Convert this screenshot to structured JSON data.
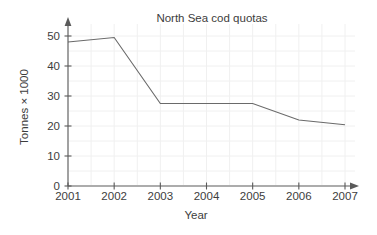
{
  "chart_data": {
    "type": "line",
    "title": "North Sea cod quotas",
    "xlabel": "Year",
    "ylabel": "Tonnes × 1000",
    "x": [
      2001,
      2002,
      2003,
      2004,
      2005,
      2006,
      2007
    ],
    "categories": [
      "2001",
      "2002",
      "2003",
      "2004",
      "2005",
      "2006",
      "2007"
    ],
    "values": [
      48,
      49.5,
      27.5,
      27.5,
      27.5,
      22,
      20.4
    ],
    "xtick_labels": [
      "2001",
      "2002",
      "2003",
      "2004",
      "2005",
      "2006",
      "2007"
    ],
    "ytick_labels": [
      "0",
      "10",
      "20",
      "30",
      "40",
      "50"
    ],
    "ytick_values": [
      0,
      10,
      20,
      30,
      40,
      50
    ],
    "xlim": [
      2001,
      2007
    ],
    "ylim": [
      0,
      53
    ],
    "grid": true,
    "legend": false,
    "series": [
      {
        "name": "North Sea cod quotas",
        "values": [
          48,
          49.5,
          27.5,
          27.5,
          27.5,
          22,
          20.4
        ]
      }
    ],
    "colors": {
      "line": "#6a6a6a",
      "axis": "#5a5a5a",
      "grid": "#f0f0f0",
      "text": "#3d3d3d",
      "background": "#ffffff"
    }
  }
}
